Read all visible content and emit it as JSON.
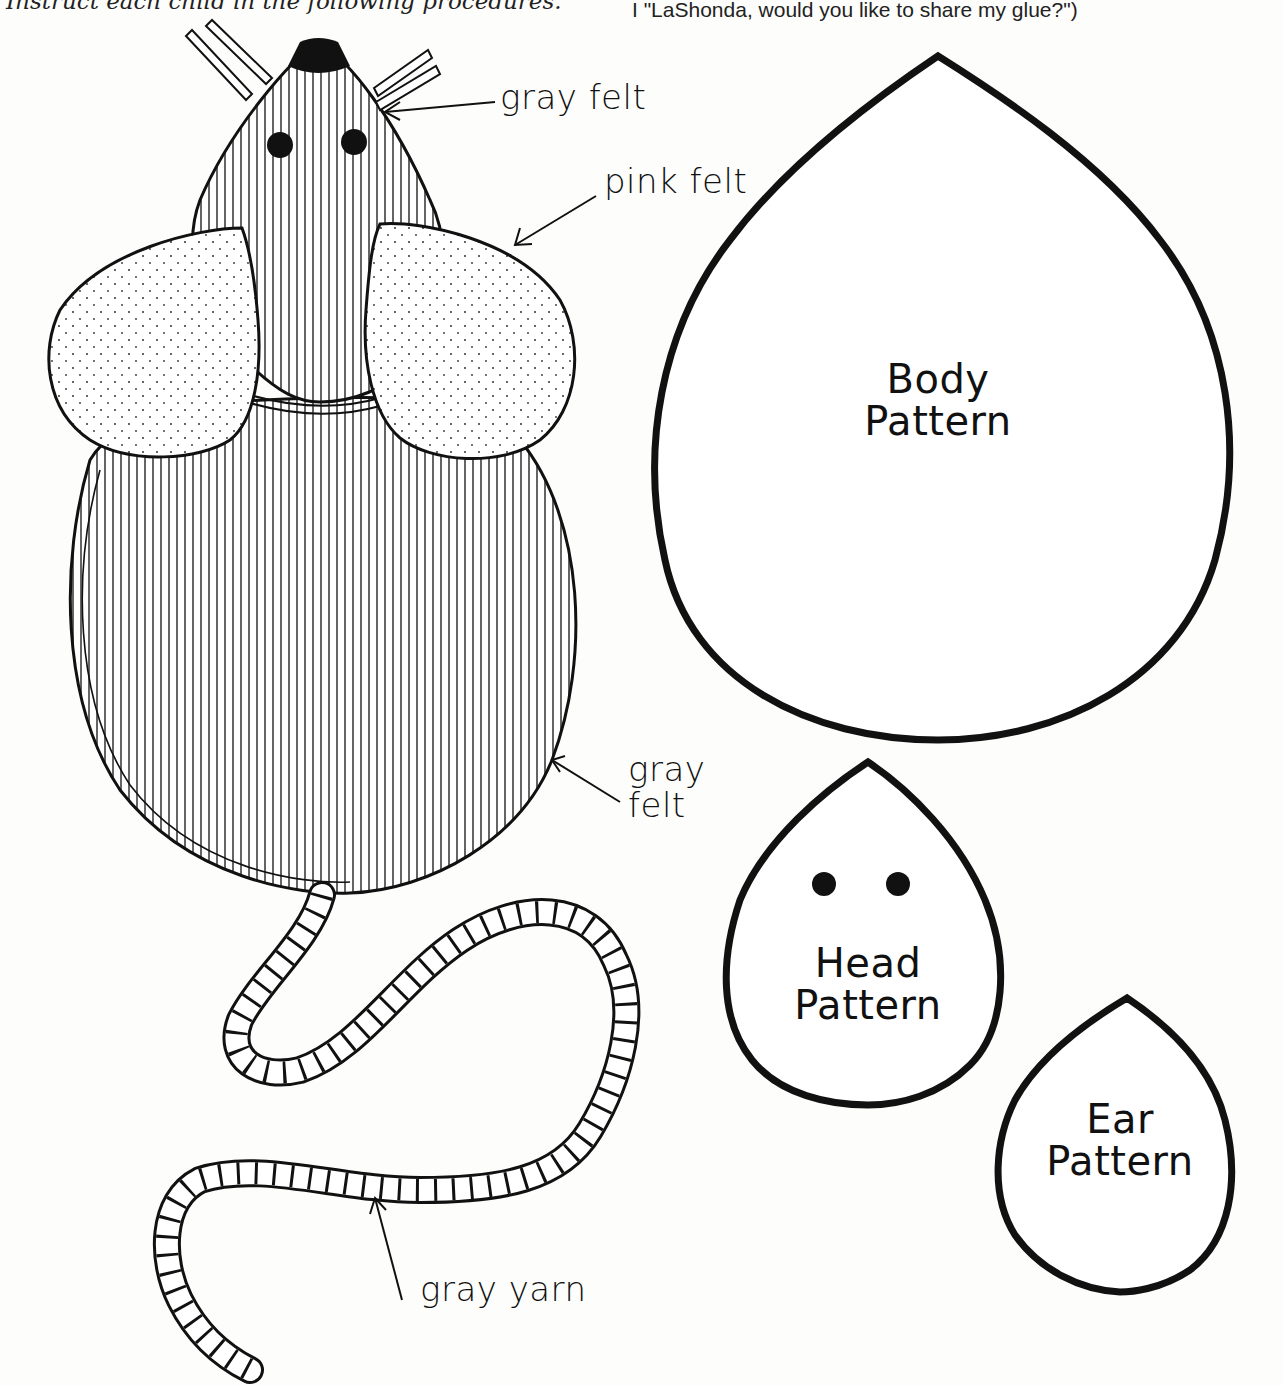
{
  "header": {
    "left_text": "Instruct each child in the following procedures.",
    "right_text": "I \"LaShonda, would you like to share my glue?\")"
  },
  "mouse_illustration": {
    "labels": {
      "nose": "gray felt",
      "ear": "pink felt",
      "body": "gray felt",
      "tail": "gray yarn"
    }
  },
  "patterns": {
    "body": {
      "line1": "Body",
      "line2": "Pattern"
    },
    "head": {
      "line1": "Head",
      "line2": "Pattern"
    },
    "ear": {
      "line1": "Ear",
      "line2": "Pattern"
    }
  },
  "colors": {
    "ink": "#111111",
    "paper": "#fdfdfb"
  }
}
